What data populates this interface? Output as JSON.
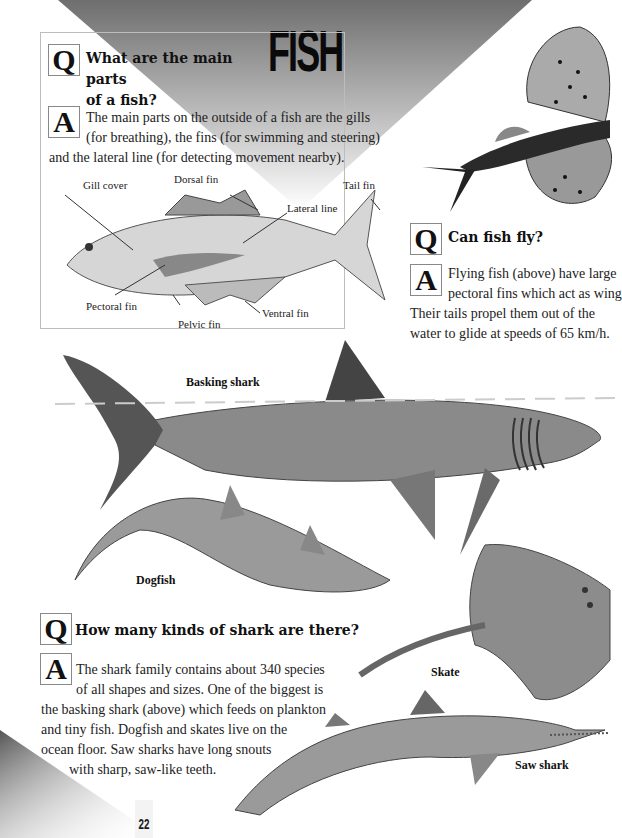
{
  "page": {
    "title": "FISH",
    "page_number": "22"
  },
  "section_parts": {
    "q_letter": "Q",
    "question": "What are the main parts of a fish?",
    "question_lines": [
      "What are the main parts",
      "of a fish?"
    ],
    "a_letter": "A",
    "answer_lines": [
      "The main parts on the outside of a fish are the gills",
      "(for breathing), the fins (for swimming and steering)",
      "and the lateral line (for detecting movement nearby)."
    ],
    "diagram_labels": {
      "gill_cover": "Gill cover",
      "dorsal_fin": "Dorsal fin",
      "tail_fin": "Tail fin",
      "lateral_line": "Lateral line",
      "pectoral_fin": "Pectoral fin",
      "pelvic_fin": "Pelvic fin",
      "ventral_fin": "Ventral fin"
    }
  },
  "section_fly": {
    "q_letter": "Q",
    "question": "Can fish fly?",
    "a_letter": "A",
    "answer_lines": [
      "Flying fish (above) have large",
      "pectoral fins which act as wing",
      "Their tails propel them out of the",
      "water to glide at speeds of 65 km/h."
    ]
  },
  "illustrations": {
    "basking_shark": "Basking shark",
    "dogfish": "Dogfish",
    "skate": "Skate",
    "saw_shark": "Saw shark"
  },
  "section_sharks": {
    "q_letter": "Q",
    "question": "How many kinds of shark are there?",
    "a_letter": "A",
    "answer_lines": [
      "The shark family contains about 340 species",
      "of all shapes and sizes. One of the biggest is",
      "the basking shark (above) which feeds on plankton",
      "and tiny fish. Dogfish and skates live on the",
      "ocean floor. Saw sharks have long snouts",
      "with sharp, saw-like teeth."
    ]
  },
  "colors": {
    "banner_dark": "#6e6e6e",
    "banner_light": "#ffffff",
    "text": "#1a1a1a",
    "box_border": "#bdbdbd"
  }
}
